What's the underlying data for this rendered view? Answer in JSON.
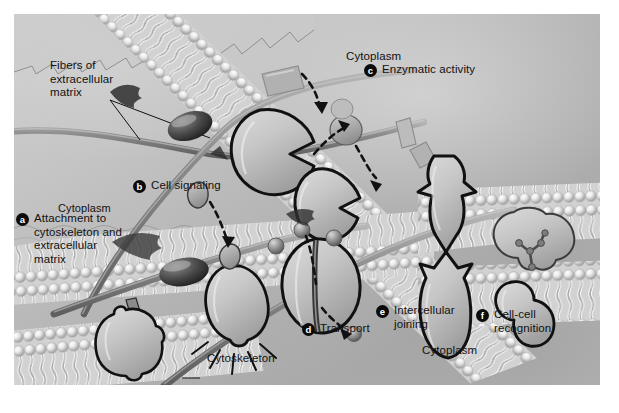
{
  "figure": {
    "type": "cell-biology-illustration"
  },
  "regions": {
    "cytoplasm_top": "Cytoplasm",
    "cytoplasm_bottom": "Cytoplasm"
  },
  "annotations": {
    "fibers": "Fibers of\nextracellular\nmatrix",
    "cytoskeleton": "Cytoskeleton"
  },
  "keys": [
    {
      "id": "a",
      "letter": "a",
      "label": "Attachment to cytoskeleton and extracellular matrix"
    },
    {
      "id": "b",
      "letter": "b",
      "label": "Cell signaling"
    },
    {
      "id": "c",
      "letter": "c",
      "label": "Enzymatic activity"
    },
    {
      "id": "d",
      "letter": "d",
      "label": "Transport"
    },
    {
      "id": "e",
      "letter": "e",
      "label": "Intercellular joining"
    },
    {
      "id": "f",
      "letter": "f",
      "label": "Cell-cell recognition"
    }
  ],
  "colors": {
    "background_extracellular": "#c9c9c9",
    "background_cytoplasm": "#ababab",
    "membrane_head": "#e6e6e6",
    "membrane_tail": "#f2f2f2",
    "protein_fill": "#c3c3c3",
    "protein_outline": "#111111",
    "fiber": "#8e8e8e",
    "text": "#111111",
    "badge": "#0b0b0b",
    "plate_border": "#ffffff"
  }
}
